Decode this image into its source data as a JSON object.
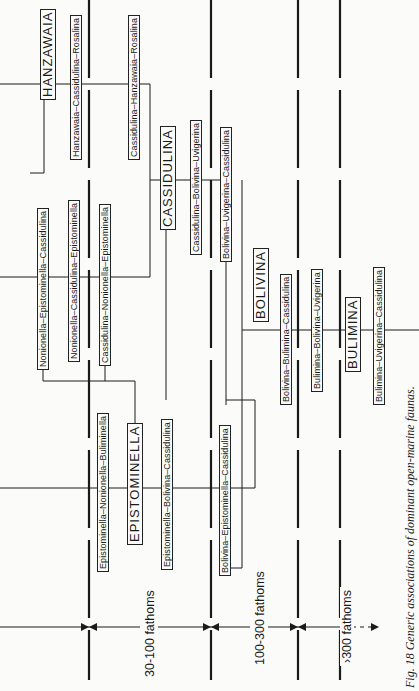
{
  "figure": {
    "caption": "Fig. 18   Generic associations of dominant open-marine faunas."
  },
  "depth_zones": [
    {
      "label": "30-100 fathoms"
    },
    {
      "label": "100-300 fathoms"
    },
    {
      "label": "›300 fathoms"
    }
  ],
  "genera": {
    "hanzawaia": "HANZAWAIA",
    "cassidulina": "CASSIDULINA",
    "epistominella": "EPISTOMINELLA",
    "bolivina": "BOLIVINA",
    "bulimina": "BULIMINA"
  },
  "associations": {
    "hanzawaia_cassidulina_rosalina": "Hanzawaia–Cassidulina–Rosalina",
    "cassidulina_hanzawaia_rosalina": "Cassidulina–Hanzawaia–Rosalina",
    "nonionella_epistominella_cassidulina": "Nonionella–Epistominella–Cassidulina",
    "nonionella_cassidulina_epistominella": "Nonionella–Cassidulina–Epistominella",
    "cassidulina_nonionella_epistominella": "Cassidulina–Nonionella–Epistominella",
    "cassidulina_bolivina_uvigerina": "Cassidulina–Bolivina–Uvigerina",
    "bolivina_uvigerina_cassidulina": "Bolivina–Uvigerina–Cassidulina",
    "epistominella_nonionella_buliminella": "Epistominella–Nonionella–Buliminella",
    "epistominella_bolivina_cassidulina": "Epistominella–Bolivina–Cassidulina",
    "bolivina_epistominella_cassidulina": "Bolivina–Epistominella–Cassidulina",
    "bolivina_bulimina_cassidulina": "Bolivina–Bulimina–Cassidulina",
    "bulimina_bolivina_uvigerina": "Bulimina–Bolivina–Uvigerina",
    "bulimina_uvigerina_cassidulina": "Bulimina–Uvigerina–Cassidulina"
  },
  "colors": {
    "ink": "#1a1a1a",
    "paper": "#fbfbf9"
  }
}
